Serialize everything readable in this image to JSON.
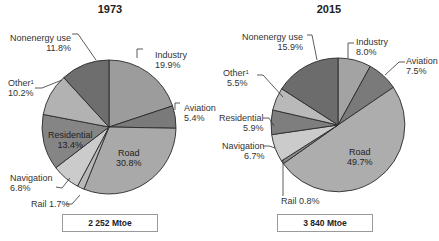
{
  "chart_data": [
    {
      "type": "pie",
      "title": "1973",
      "total_label": "2 252 Mtoe",
      "start_angle_deg": 0,
      "direction": "clockwise",
      "slices": [
        {
          "label": "Industry",
          "value": 19.9,
          "display": "19.9%",
          "color": "#9c9c9c"
        },
        {
          "label": "Aviation",
          "value": 5.4,
          "display": "5.4%",
          "color": "#7a7a7a"
        },
        {
          "label": "Road",
          "value": 30.8,
          "display": "30.8%",
          "color": "#a9a9a9"
        },
        {
          "label": "Rail",
          "value": 1.7,
          "display": "1.7%",
          "color": "#b8b8b8"
        },
        {
          "label": "Navigation",
          "value": 6.8,
          "display": "6.8%",
          "color": "#cbcbcb"
        },
        {
          "label": "Residential",
          "value": 13.4,
          "display": "13.4%",
          "color": "#858585"
        },
        {
          "label": "Other",
          "superscript": "1",
          "value": 10.2,
          "display": "10.2%",
          "color": "#b2b2b2"
        },
        {
          "label": "Nonenergy use",
          "value": 11.8,
          "display": "11.8%",
          "color": "#6e6e6e"
        }
      ]
    },
    {
      "type": "pie",
      "title": "2015",
      "total_label": "3 840 Mtoe",
      "start_angle_deg": 0,
      "direction": "clockwise",
      "slices": [
        {
          "label": "Industry",
          "value": 8.0,
          "display": "8.0%",
          "color": "#a3a3a3"
        },
        {
          "label": "Aviation",
          "value": 7.5,
          "display": "7.5%",
          "color": "#7a7a7a"
        },
        {
          "label": "Road",
          "value": 49.7,
          "display": "49.7%",
          "color": "#adadad"
        },
        {
          "label": "Rail",
          "value": 0.8,
          "display": "0.8%",
          "color": "#8a8a8a"
        },
        {
          "label": "Navigation",
          "value": 6.7,
          "display": "6.7%",
          "color": "#cbcbcb"
        },
        {
          "label": "Residential",
          "value": 5.9,
          "display": "5.9%",
          "color": "#7e7e7e"
        },
        {
          "label": "Other",
          "superscript": "1",
          "value": 5.5,
          "display": "5.5%",
          "color": "#b9b9b9"
        },
        {
          "label": "Nonenergy use",
          "value": 15.9,
          "display": "15.9%",
          "color": "#6c6c6c"
        }
      ]
    }
  ],
  "labels": {
    "p1973": {
      "title": "1973",
      "nonenergy": "Nonenergy use",
      "nonenergy_pct": "11.8%",
      "industry": "Industry",
      "industry_pct": "19.9%",
      "other": "Other",
      "other_sup": "1",
      "other_pct": "10.2%",
      "aviation": "Aviation",
      "aviation_pct": "5.4%",
      "residential": "Residential",
      "residential_pct": "13.4%",
      "road": "Road",
      "road_pct": "30.8%",
      "navigation": "Navigation",
      "navigation_pct": "6.8%",
      "rail": "Rail 1.7%",
      "total": "2 252 Mtoe"
    },
    "p2015": {
      "title": "2015",
      "nonenergy": "Nonenergy use",
      "nonenergy_pct": "15.9%",
      "industry": "Industry",
      "industry_pct": "8.0%",
      "other": "Other",
      "other_sup": "1",
      "other_pct": "5.5%",
      "aviation": "Aviation",
      "aviation_pct": "7.5%",
      "residential": "Residential",
      "residential_pct": "5.9%",
      "road": "Road",
      "road_pct": "49.7%",
      "navigation": "Navigation",
      "navigation_pct": "6.7%",
      "rail": "Rail 0.8%",
      "total": "3 840 Mtoe"
    }
  }
}
